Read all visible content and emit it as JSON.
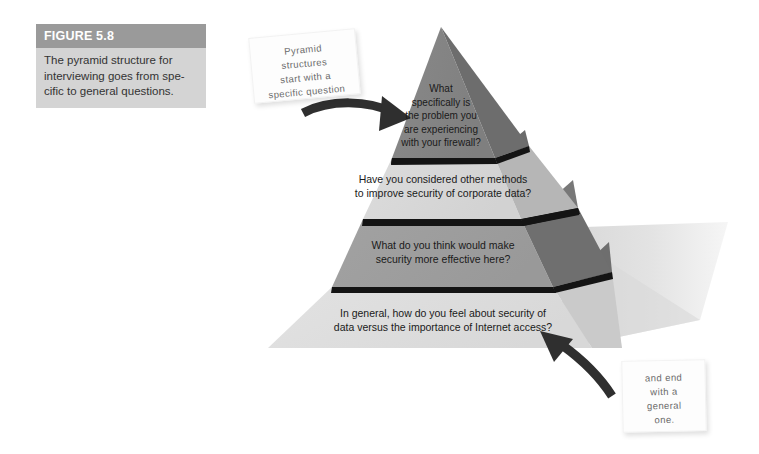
{
  "figure": {
    "label": "FIGURE 5.8",
    "caption": "The pyramid structure for interviewing goes from spe-cific to general questions."
  },
  "notes": {
    "top": "Pyramid\nstructures\nstart with a\nspecific question",
    "bottom": "and end\nwith a\ngeneral\none."
  },
  "pyramid": {
    "tiers": [
      {
        "index": 1,
        "position": "top",
        "text": "What\nspecifically is\nthe problem you\nare experiencing\nwith your firewall?",
        "face_color": "#8c8c8c",
        "side_color": "#6e6e6e"
      },
      {
        "index": 2,
        "position": "upper-middle",
        "text": "Have you considered other methods\nto improve security of corporate data?",
        "face_color": "#d8d8d8",
        "side_color": "#b4b4b4"
      },
      {
        "index": 3,
        "position": "lower-middle",
        "text": "What do you think would make\nsecurity more effective here?",
        "face_color": "#9e9e9e",
        "side_color": "#767676"
      },
      {
        "index": 4,
        "position": "bottom",
        "text": "In general, how do you feel about security of\ndata versus the importance of Internet access?",
        "face_color": "#dedede",
        "side_color": "#c0c0c0"
      }
    ],
    "edge_color": "#1a1a1a",
    "shadow_color": "#e4e4e4"
  },
  "arrows": [
    {
      "name": "arrow-to-top-tier",
      "direction": "left-to-right",
      "color": "#333333",
      "points_to": "top tier of pyramid"
    },
    {
      "name": "arrow-to-bottom-tier",
      "direction": "right-to-upper-left",
      "color": "#333333",
      "points_to": "bottom tier of pyramid"
    }
  ],
  "colors": {
    "caption_header_bg": "#9a9a9a",
    "caption_body_bg": "#d4d4d4",
    "page_bg": "#ffffff",
    "note_bg": "#fdfdfd",
    "note_text": "#6c6c6c"
  }
}
